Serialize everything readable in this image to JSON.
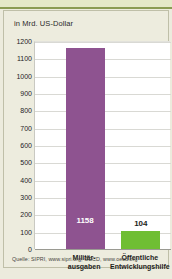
{
  "chart_data": {
    "type": "bar",
    "title": "",
    "unit_label": "in Mrd. US-Dollar",
    "xlabel": "",
    "ylabel": "in Mrd. US-Dollar",
    "categories": [
      "Militär-\nausgaben",
      "Öffentliche\nEntwicklungshilfe"
    ],
    "category_lines": [
      [
        "Militär-",
        "ausgaben"
      ],
      [
        "Öffentliche",
        "Entwicklungshilfe"
      ]
    ],
    "values": [
      1158,
      104
    ],
    "value_labels": [
      "1158",
      "104"
    ],
    "colors": [
      "#8e5390",
      "#6fbe33"
    ],
    "ylim": [
      0,
      1200
    ],
    "ytick_step": 100,
    "yticks": [
      "1200",
      "1100",
      "1000",
      "900",
      "800",
      "700",
      "600",
      "500",
      "400",
      "300",
      "200",
      "100",
      "0"
    ],
    "grid": true,
    "legend": "none"
  },
  "source": {
    "text": "Quelle: SIPRI, www.sipri.org; OECD, www.oecd.org"
  },
  "theme": {
    "panel_background": "#edecde",
    "plot_background": "#ffffff",
    "page_background": "#dfe3c4",
    "grid_color": "#d9d9d4",
    "axis_color": "#9a9a92",
    "text_color": "#23231f"
  }
}
